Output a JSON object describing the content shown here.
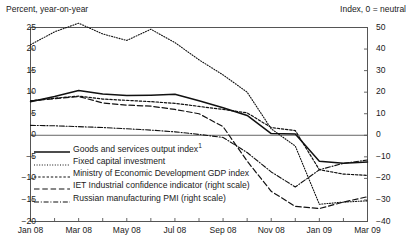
{
  "header": {
    "left_axis_title": "Percent, year-on-year",
    "right_axis_title": "Index, 0 = neutral"
  },
  "axes": {
    "left_ticks": [
      "25",
      "20",
      "15",
      "10",
      "5",
      "0",
      "−5",
      "−10",
      "−15",
      "−20"
    ],
    "right_ticks": [
      "50",
      "40",
      "30",
      "20",
      "10",
      "0",
      "−10",
      "−20",
      "−30",
      "−40"
    ],
    "x_ticks": [
      "Jan 08",
      "Mar 08",
      "May 08",
      "Jul 08",
      "Sep 08",
      "Nov 08",
      "Jan 09",
      "Mar 09"
    ]
  },
  "legend": {
    "items": [
      {
        "label": "Goods and services output index",
        "footnote": "1",
        "style": "solid"
      },
      {
        "label": "Fixed capital investment",
        "footnote": "",
        "style": "dotted"
      },
      {
        "label": "Ministry of Economic Development GDP index",
        "footnote": "",
        "style": "dashed-short"
      },
      {
        "label": "IET Industrial confidence indicator (right scale)",
        "footnote": "",
        "style": "dashed-long"
      },
      {
        "label": "Russian manufacturing PMI (right scale)",
        "footnote": "",
        "style": "dash-dot"
      }
    ]
  },
  "chart_data": {
    "type": "line",
    "title": "",
    "xlabel": "",
    "ylabel": "Percent, year-on-year",
    "y2label": "Index, 0 = neutral",
    "ylim": [
      -20,
      25
    ],
    "y2lim": [
      -40,
      50
    ],
    "grid": false,
    "legend_position": "inside-lower-left",
    "x": [
      "Jan 08",
      "Feb 08",
      "Mar 08",
      "Apr 08",
      "May 08",
      "Jun 08",
      "Jul 08",
      "Aug 08",
      "Sep 08",
      "Oct 08",
      "Nov 08",
      "Dec 08",
      "Jan 09",
      "Feb 09",
      "Mar 09"
    ],
    "series": [
      {
        "name": "Goods and services output index",
        "axis": "left",
        "style": "solid",
        "values": [
          7.8,
          9.0,
          10.4,
          9.6,
          9.2,
          9.3,
          9.5,
          8.0,
          6.4,
          4.6,
          0.4,
          0.3,
          -6.0,
          -6.5,
          -6.2
        ]
      },
      {
        "name": "Fixed capital investment",
        "axis": "left",
        "style": "dotted",
        "values": [
          21.0,
          24.0,
          26.0,
          23.5,
          22.0,
          24.6,
          21.5,
          17.5,
          14.0,
          10.0,
          1.5,
          -2.5,
          -16.0,
          -15.5,
          -15.2
        ]
      },
      {
        "name": "Ministry of Economic Development GDP index",
        "axis": "left",
        "style": "dashed-short",
        "values": [
          8.0,
          8.6,
          9.1,
          8.4,
          8.1,
          7.8,
          7.4,
          6.7,
          6.0,
          5.2,
          1.8,
          1.1,
          -8.0,
          -9.0,
          -9.3
        ]
      },
      {
        "name": "IET Industrial confidence indicator",
        "axis": "right",
        "style": "dashed-long",
        "values": [
          16.0,
          17.0,
          18.0,
          15.0,
          14.0,
          13.5,
          12.0,
          10.0,
          4.0,
          -12.0,
          -26.0,
          -33.0,
          -34.0,
          -31.0,
          -28.5
        ]
      },
      {
        "name": "Russian manufacturing PMI",
        "axis": "right",
        "style": "dash-dot",
        "values": [
          4.6,
          4.4,
          4.0,
          3.6,
          3.0,
          2.4,
          1.6,
          0.4,
          -1.0,
          -8.0,
          -17.0,
          -24.0,
          -16.0,
          -13.0,
          -11.5
        ]
      }
    ]
  }
}
